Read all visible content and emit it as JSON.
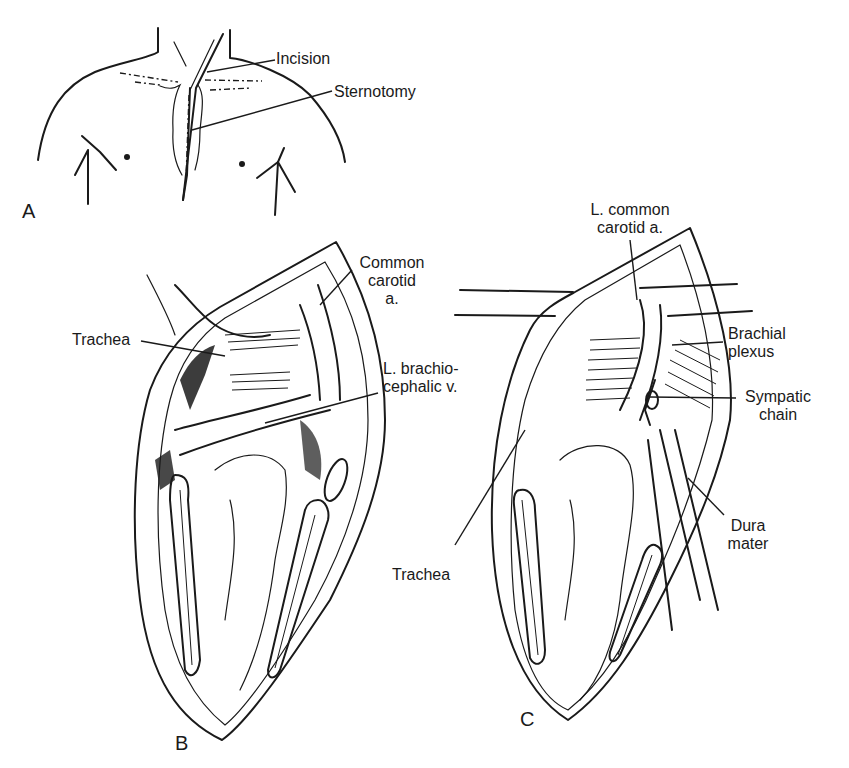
{
  "figure": {
    "panels": [
      {
        "id": "A",
        "letter": "A",
        "description": "Chest outline showing incision and sternotomy",
        "labels": {
          "incision": "Incision",
          "sternotomy": "Sternotomy"
        }
      },
      {
        "id": "B",
        "letter": "B",
        "description": "Open sternotomy view showing trachea and great vessels",
        "labels": {
          "common_carotid_line1": "Common",
          "common_carotid_line2": "carotid",
          "common_carotid_line3": "a.",
          "trachea": "Trachea",
          "brachiocephalic_line1": "L. brachio-",
          "brachiocephalic_line2": "cephalic v."
        }
      },
      {
        "id": "C",
        "letter": "C",
        "description": "Retracted view exposing brachial plexus, sympathetic chain and dura mater",
        "labels": {
          "l_common_carotid_line1": "L. common",
          "l_common_carotid_line2": "carotid a.",
          "brachial_plexus_line1": "Brachial",
          "brachial_plexus_line2": "plexus",
          "sympatic_chain_line1": "Sympatic",
          "sympatic_chain_line2": "chain",
          "dura_mater_line1": "Dura",
          "dura_mater_line2": "mater",
          "trachea": "Trachea"
        }
      }
    ]
  }
}
